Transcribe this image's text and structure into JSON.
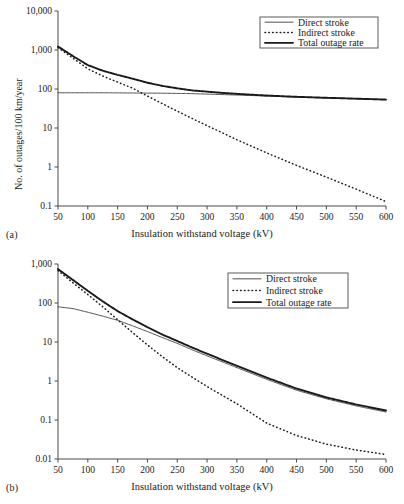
{
  "figure": {
    "panels": [
      {
        "id": "a",
        "panel_label": "(a)",
        "xlabel": "Insulation withstand voltage (kV)",
        "ylabel": "No. of outages/100 km/year",
        "legend": [
          {
            "label": "Direct stroke",
            "style": "thin-solid"
          },
          {
            "label": "Indirect stroke",
            "style": "dotted"
          },
          {
            "label": "Total outage rate",
            "style": "thick-solid"
          }
        ]
      },
      {
        "id": "b",
        "panel_label": "(b)",
        "xlabel": "Insulation withstand voltage (kV)",
        "ylabel": "No. of outages/100 km/year",
        "legend": [
          {
            "label": "Direct stroke",
            "style": "thin-solid"
          },
          {
            "label": "Indirect stroke",
            "style": "dotted"
          },
          {
            "label": "Total outage rate",
            "style": "thick-solid"
          }
        ]
      }
    ]
  },
  "chart_data": [
    {
      "type": "line",
      "id": "a",
      "title": "",
      "panel_label": "(a)",
      "xlabel": "Insulation withstand voltage (kV)",
      "ylabel": "No. of outages/100 km/year",
      "xlim": [
        50,
        600
      ],
      "xticks": [
        50,
        100,
        150,
        200,
        250,
        300,
        350,
        400,
        450,
        500,
        550,
        600
      ],
      "xticklabels": [
        "50",
        "100",
        "150",
        "200",
        "250",
        "300",
        "350",
        "400",
        "450",
        "500",
        "550",
        "600"
      ],
      "yscale": "log",
      "ylim": [
        0.1,
        10000
      ],
      "yticks": [
        0.1,
        1,
        10,
        100,
        1000,
        10000
      ],
      "yticklabels": [
        "0.1",
        "1",
        "10",
        "100",
        "1,000",
        "10,000"
      ],
      "grid": false,
      "legend_position": "top-right",
      "x": [
        50,
        75,
        100,
        125,
        150,
        175,
        200,
        225,
        250,
        275,
        300,
        325,
        350,
        400,
        450,
        500,
        550,
        600
      ],
      "series": [
        {
          "name": "Direct stroke",
          "style": "thin-solid",
          "values": [
            80,
            80,
            80,
            80,
            79.5,
            79,
            78.5,
            78,
            77,
            76,
            74,
            72,
            70,
            66,
            62,
            59,
            56,
            53
          ]
        },
        {
          "name": "Indirect stroke",
          "style": "dotted",
          "values": [
            1150,
            620,
            330,
            215,
            150,
            105,
            66,
            42,
            27,
            17.5,
            11.5,
            7.6,
            5.0,
            2.3,
            1.1,
            0.55,
            0.27,
            0.13
          ]
        },
        {
          "name": "Total outage rate",
          "style": "thick-solid",
          "values": [
            1230,
            700,
            410,
            295,
            230,
            184,
            145,
            120,
            104,
            92,
            85.5,
            79.5,
            75,
            68,
            63,
            59.5,
            56.5,
            53.5
          ]
        }
      ]
    },
    {
      "type": "line",
      "id": "b",
      "title": "",
      "panel_label": "(b)",
      "xlabel": "Insulation withstand voltage (kV)",
      "ylabel": "No. of outages/100 km/year",
      "xlim": [
        50,
        600
      ],
      "xticks": [
        50,
        100,
        150,
        200,
        250,
        300,
        350,
        400,
        450,
        500,
        550,
        600
      ],
      "xticklabels": [
        "50",
        "100",
        "150",
        "200",
        "250",
        "300",
        "350",
        "400",
        "450",
        "500",
        "550",
        "600"
      ],
      "yscale": "log",
      "ylim": [
        0.01,
        1000
      ],
      "yticks": [
        0.01,
        0.1,
        1,
        10,
        100,
        1000
      ],
      "yticklabels": [
        "0.01",
        "0.1",
        "1",
        "10",
        "100",
        "1,000"
      ],
      "grid": false,
      "legend_position": "top-right",
      "x": [
        50,
        75,
        100,
        125,
        150,
        175,
        200,
        225,
        250,
        275,
        300,
        350,
        400,
        450,
        500,
        550,
        600
      ],
      "series": [
        {
          "name": "Direct stroke",
          "style": "thin-solid",
          "values": [
            80,
            72,
            58,
            46,
            36,
            26,
            18.5,
            13.0,
            9.2,
            6.3,
            4.4,
            2.2,
            1.1,
            0.58,
            0.35,
            0.23,
            0.16
          ]
        },
        {
          "name": "Indirect stroke",
          "style": "dotted",
          "values": [
            680,
            330,
            165,
            80,
            37,
            17.5,
            8.4,
            4.2,
            2.2,
            1.25,
            0.72,
            0.26,
            0.083,
            0.04,
            0.024,
            0.017,
            0.013
          ]
        },
        {
          "name": "Total outage rate",
          "style": "thick-solid",
          "values": [
            740,
            390,
            205,
            110,
            62,
            38,
            24,
            15.5,
            10.6,
            7.2,
            5.0,
            2.45,
            1.22,
            0.64,
            0.38,
            0.25,
            0.175
          ]
        }
      ]
    }
  ]
}
